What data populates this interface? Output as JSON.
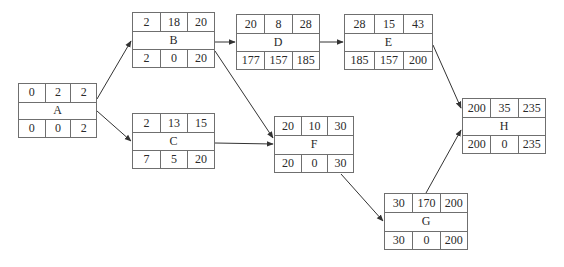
{
  "diagram": {
    "type": "activity-on-node network",
    "nodes": [
      {
        "id": "A",
        "name": "A",
        "top": [
          "0",
          "2",
          "2"
        ],
        "bottom": [
          "0",
          "0",
          "2"
        ],
        "x": 18,
        "y": 83,
        "w": 79,
        "h": 55
      },
      {
        "id": "B",
        "name": "B",
        "top": [
          "2",
          "18",
          "20"
        ],
        "bottom": [
          "2",
          "0",
          "20"
        ],
        "x": 132,
        "y": 12,
        "w": 83,
        "h": 56
      },
      {
        "id": "C",
        "name": "C",
        "top": [
          "2",
          "13",
          "15"
        ],
        "bottom": [
          "7",
          "5",
          "20"
        ],
        "x": 132,
        "y": 113,
        "w": 83,
        "h": 56
      },
      {
        "id": "D",
        "name": "D",
        "top": [
          "20",
          "8",
          "28"
        ],
        "bottom": [
          "177",
          "157",
          "185"
        ],
        "x": 236,
        "y": 14,
        "w": 84,
        "h": 56
      },
      {
        "id": "E",
        "name": "E",
        "top": [
          "28",
          "15",
          "43"
        ],
        "bottom": [
          "185",
          "157",
          "200"
        ],
        "x": 344,
        "y": 14,
        "w": 89,
        "h": 56
      },
      {
        "id": "F",
        "name": "F",
        "top": [
          "20",
          "10",
          "30"
        ],
        "bottom": [
          "20",
          "0",
          "30"
        ],
        "x": 274,
        "y": 116,
        "w": 80,
        "h": 57
      },
      {
        "id": "G",
        "name": "G",
        "top": [
          "30",
          "170",
          "200"
        ],
        "bottom": [
          "30",
          "0",
          "200"
        ],
        "x": 384,
        "y": 193,
        "w": 84,
        "h": 57
      },
      {
        "id": "H",
        "name": "H",
        "top": [
          "200",
          "35",
          "235"
        ],
        "bottom": [
          "200",
          "0",
          "235"
        ],
        "x": 462,
        "y": 98,
        "w": 84,
        "h": 56
      }
    ],
    "edges": [
      {
        "from": "A",
        "to": "B"
      },
      {
        "from": "A",
        "to": "C"
      },
      {
        "from": "B",
        "to": "D"
      },
      {
        "from": "B",
        "to": "F"
      },
      {
        "from": "C",
        "to": "F"
      },
      {
        "from": "D",
        "to": "E"
      },
      {
        "from": "E",
        "to": "H"
      },
      {
        "from": "F",
        "to": "G"
      },
      {
        "from": "G",
        "to": "H"
      }
    ]
  }
}
